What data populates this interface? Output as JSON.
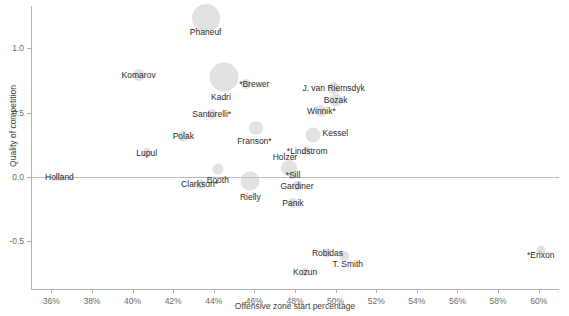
{
  "chart_data": {
    "type": "scatter",
    "title": "",
    "xlabel": "Offensive zone start percentage",
    "ylabel": "Quality of competition",
    "xlim": [
      35.0,
      61.0
    ],
    "ylim": [
      -0.87,
      1.33
    ],
    "grid": false,
    "legend": "none",
    "x_tick_labels": [
      "36%",
      "38%",
      "40%",
      "42%",
      "44%",
      "46%",
      "48%",
      "50%",
      "52%",
      "54%",
      "56%",
      "58%",
      "60%"
    ],
    "x_tick_values": [
      36,
      38,
      40,
      42,
      44,
      46,
      48,
      50,
      52,
      54,
      56,
      58,
      60
    ],
    "y_tick_labels": [
      "1.0",
      "0.5",
      "0.0",
      "-0.5"
    ],
    "y_tick_values": [
      1.0,
      0.5,
      0.0,
      -0.5
    ],
    "zero_reference_line": 0.0,
    "bubble_size_encodes": "ice time",
    "points": [
      {
        "label": "Phaneuf",
        "x": 43.6,
        "y": 1.24,
        "size": 14.0,
        "label_dx": 0,
        "label_dy": 14
      },
      {
        "label": "Komarov",
        "x": 40.3,
        "y": 0.79,
        "size": 6.0,
        "label_dx": 0,
        "label_dy": 0
      },
      {
        "label": "Kadri",
        "x": 44.5,
        "y": 0.78,
        "size": 14.5,
        "label_dx": -3,
        "label_dy": 20
      },
      {
        "label": "*Brewer",
        "x": 45.6,
        "y": 0.72,
        "size": 5.0,
        "label_dx": 8,
        "label_dy": 0
      },
      {
        "label": "J. van Riemsdyk",
        "x": 49.9,
        "y": 0.69,
        "size": 6.0,
        "label_dx": 0,
        "label_dy": 0
      },
      {
        "label": "Bozak",
        "x": 50.0,
        "y": 0.6,
        "size": 6.5,
        "label_dx": 0,
        "label_dy": 0
      },
      {
        "label": "Winnik*",
        "x": 49.3,
        "y": 0.51,
        "size": 6.0,
        "label_dx": 0,
        "label_dy": 0
      },
      {
        "label": "Santorelli*",
        "x": 43.9,
        "y": 0.49,
        "size": 5.0,
        "label_dx": 0,
        "label_dy": 0
      },
      {
        "label": "Franson*",
        "x": 46.1,
        "y": 0.38,
        "size": 7.0,
        "label_dx": -2,
        "label_dy": 13
      },
      {
        "label": "Kessel",
        "x": 48.9,
        "y": 0.33,
        "size": 7.5,
        "label_dx": 22,
        "label_dy": -2
      },
      {
        "label": "Polak",
        "x": 42.5,
        "y": 0.32,
        "size": 5.5,
        "label_dx": 0,
        "label_dy": 0
      },
      {
        "label": "Lupul",
        "x": 40.7,
        "y": 0.19,
        "size": 5.0,
        "label_dx": 0,
        "label_dy": 0
      },
      {
        "label": "*Lindstrom",
        "x": 48.6,
        "y": 0.2,
        "size": 4.0,
        "label_dx": 0,
        "label_dy": 0
      },
      {
        "label": "Holzer",
        "x": 47.7,
        "y": 0.07,
        "size": 8.0,
        "label_dx": -4,
        "label_dy": -11
      },
      {
        "label": "*Sill",
        "x": 47.9,
        "y": 0.02,
        "size": 4.0,
        "label_dx": 0,
        "label_dy": 0
      },
      {
        "label": "Booth",
        "x": 44.2,
        "y": 0.06,
        "size": 5.5,
        "label_dx": 0,
        "label_dy": 11
      },
      {
        "label": "Holland",
        "x": 36.4,
        "y": 0.0,
        "size": 4.0,
        "label_dx": 0,
        "label_dy": 0
      },
      {
        "label": "Clarkson*",
        "x": 43.3,
        "y": -0.05,
        "size": 4.5,
        "label_dx": 0,
        "label_dy": 0
      },
      {
        "label": "Rielly",
        "x": 45.8,
        "y": -0.03,
        "size": 9.5,
        "label_dx": 0,
        "label_dy": 16
      },
      {
        "label": "Gardiner",
        "x": 48.1,
        "y": -0.07,
        "size": 5.0,
        "label_dx": 0,
        "label_dy": 0
      },
      {
        "label": "Panik",
        "x": 47.9,
        "y": -0.2,
        "size": 5.0,
        "label_dx": 0,
        "label_dy": 0
      },
      {
        "label": "Robidas",
        "x": 49.6,
        "y": -0.59,
        "size": 4.5,
        "label_dx": 0,
        "label_dy": 0
      },
      {
        "label": "T. Smith",
        "x": 50.4,
        "y": -0.61,
        "size": 5.0,
        "label_dx": 4,
        "label_dy": 8
      },
      {
        "label": "Kozun",
        "x": 48.5,
        "y": -0.74,
        "size": 4.0,
        "label_dx": 0,
        "label_dy": 0
      },
      {
        "label": "*Erixon",
        "x": 60.1,
        "y": -0.57,
        "size": 4.5,
        "label_dx": 0,
        "label_dy": 5
      }
    ]
  }
}
